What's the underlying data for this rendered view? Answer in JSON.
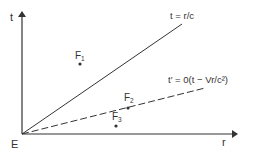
{
  "axes": {
    "x_label": "r",
    "y_label": "t",
    "origin_label": "E"
  },
  "lines": [
    {
      "name": "light-line",
      "label": "t = r/c",
      "style": "solid"
    },
    {
      "name": "simultaneity-line",
      "label": "t′ = 0(t − Vr/c²)",
      "style": "dashed"
    }
  ],
  "events": [
    {
      "name": "event-f1",
      "label": "F",
      "subscript": "1"
    },
    {
      "name": "event-f2",
      "label": "F",
      "subscript": "2"
    },
    {
      "name": "event-f3",
      "label": "F",
      "subscript": "3"
    }
  ],
  "colors": {
    "ink": "#333333",
    "background": "#ffffff"
  }
}
